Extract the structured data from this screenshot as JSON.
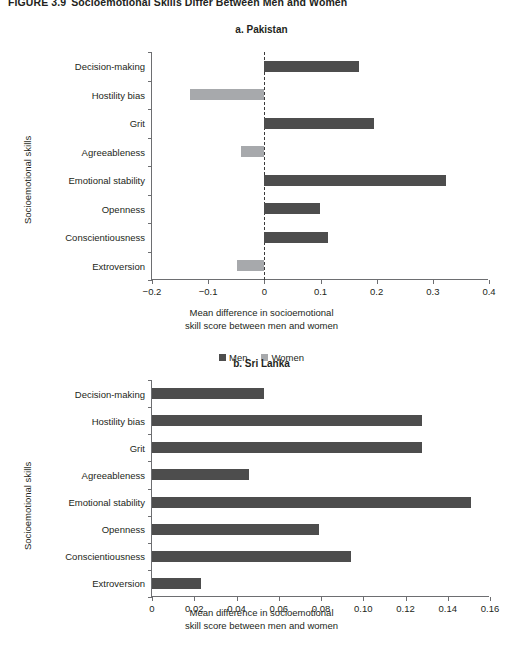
{
  "figure": {
    "number": "FIGURE 3.9",
    "caption": "Socioemotional Skills Differ Between Men and Women"
  },
  "legend": {
    "men_label": "Men",
    "women_label": "Women",
    "men_color": "#4d4d4d",
    "women_color": "#a7a9ac",
    "position": "bottom-center"
  },
  "axis_titles": {
    "y": "Socioemotional skills",
    "x_line1": "Mean difference in socioemotional",
    "x_line2": "skill score between men and women"
  },
  "chart_data": [
    {
      "type": "bar",
      "orientation": "horizontal",
      "title": "a. Pakistan",
      "xlabel": "Mean difference in socioemotional skill score between men and women",
      "ylabel": "Socioemotional skills",
      "categories": [
        "Decision-making",
        "Hostility bias",
        "Grit",
        "Agreeableness",
        "Emotional stability",
        "Openness",
        "Conscientiousness",
        "Extroversion"
      ],
      "values": [
        0.168,
        -0.132,
        0.195,
        -0.041,
        0.323,
        0.1,
        0.113,
        -0.048
      ],
      "bar_groups": [
        "Men",
        "Women",
        "Men",
        "Women",
        "Men",
        "Men",
        "Men",
        "Women"
      ],
      "xlim": [
        -0.2,
        0.4
      ],
      "xticks": [
        -0.2,
        -0.1,
        0,
        0.1,
        0.2,
        0.3,
        0.4
      ],
      "xticklabels": [
        "−0.2",
        "−0.1",
        "0",
        "0.1",
        "0.2",
        "0.3",
        "0.4"
      ],
      "zero_reference_line": 0,
      "grid": false,
      "legend": [
        "Men",
        "Women"
      ]
    },
    {
      "type": "bar",
      "orientation": "horizontal",
      "title": "b. Sri Lanka",
      "xlabel": "Mean difference in socioemotional skill score between men and women",
      "ylabel": "Socioemotional skills",
      "categories": [
        "Decision-making",
        "Hostility bias",
        "Grit",
        "Agreeableness",
        "Emotional stability",
        "Openness",
        "Conscientiousness",
        "Extroversion"
      ],
      "values": [
        0.053,
        0.128,
        0.128,
        0.046,
        0.151,
        0.079,
        0.094,
        0.023
      ],
      "bar_groups": [
        "Men",
        "Men",
        "Men",
        "Men",
        "Men",
        "Men",
        "Men",
        "Men"
      ],
      "xlim": [
        0,
        0.16
      ],
      "xticks": [
        0,
        0.02,
        0.04,
        0.06,
        0.08,
        0.1,
        0.12,
        0.14,
        0.16
      ],
      "xticklabels": [
        "0",
        "0.02",
        "0.04",
        "0.06",
        "0.08",
        "0.10",
        "0.12",
        "0.14",
        "0.16"
      ],
      "grid": false,
      "legend": []
    }
  ]
}
